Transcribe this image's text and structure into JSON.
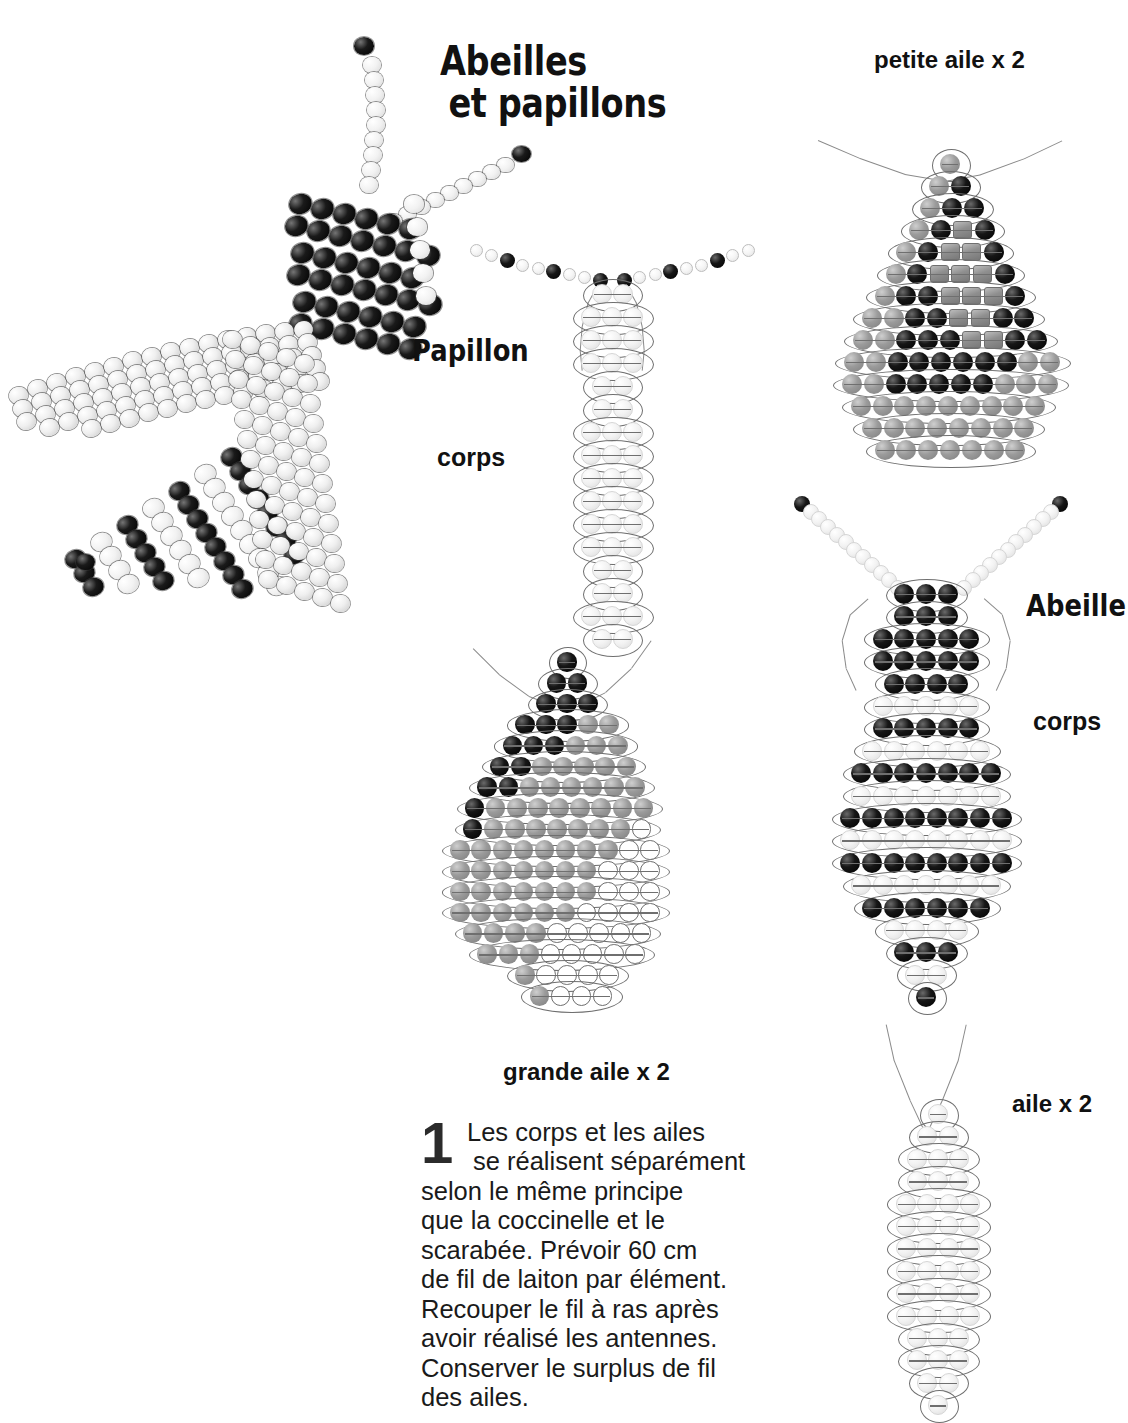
{
  "page": {
    "title_line1": "Abeilles",
    "title_line2": "et papillons",
    "background": "#ffffff"
  },
  "labels": {
    "papillon": "Papillon",
    "papillon_corps": "corps",
    "abeille": "Abeille",
    "abeille_corps": "corps",
    "petite_aile": "petite aile x 2",
    "grande_aile": "grande aile x 2",
    "aile": "aile x 2"
  },
  "step": {
    "number": "1",
    "line1": "Les corps et les ailes",
    "line2": "se réalisent séparément",
    "line3": "selon le même principe",
    "line4": "que la coccinelle et le",
    "line5": "scarabée. Prévoir 60 cm",
    "line6": "de fil de laiton par élément.",
    "line7": "Recouper le fil à ras après",
    "line8": "avoir réalisé les antennes.",
    "line9": "Conserver le surplus de fil",
    "line10": "des ailes."
  },
  "colors": {
    "bead_black": "#0b0b0b",
    "bead_white": "#f4f4f4",
    "bead_gray": "#8f8f8f",
    "bead_pale": "#ededed",
    "wire": "#787878",
    "text": "#111111"
  },
  "diagrams": {
    "photo": {
      "name": "beaded bee photograph",
      "beads": "black and white opaque rocailles"
    },
    "papillon_corps": {
      "rows": 14,
      "bead_color": "pale",
      "antennae": "black and white alternating"
    },
    "grande_aile": {
      "rows": 17,
      "shape": "teardrop",
      "palette": [
        "black",
        "gray",
        "white-outline"
      ]
    },
    "petite_aile": {
      "rows": 14,
      "shape": "diamond",
      "palette": [
        "gray",
        "black",
        "gray-square"
      ]
    },
    "abeille_corps": {
      "rows": 18,
      "palette": [
        "black",
        "pale"
      ]
    },
    "abeille_aile": {
      "rows": 14,
      "shape": "oval",
      "bead_color": "pale"
    }
  }
}
